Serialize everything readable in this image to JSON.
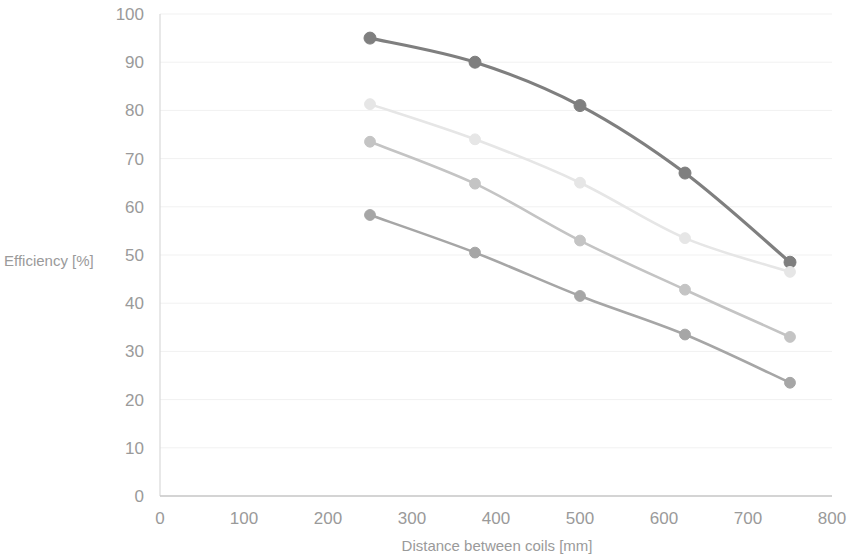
{
  "chart_data": {
    "type": "line",
    "title": "",
    "xlabel": "Distance between coils [mm]",
    "ylabel": "Efficiency [%]",
    "xlim": [
      0,
      800
    ],
    "ylim": [
      0,
      100
    ],
    "xticks": [
      0,
      100,
      200,
      300,
      400,
      500,
      600,
      700,
      800
    ],
    "yticks": [
      0,
      10,
      20,
      30,
      40,
      50,
      60,
      70,
      80,
      90,
      100
    ],
    "grid": true,
    "grid_axis": "y",
    "legend": "none",
    "markers": "circle",
    "x": [
      250,
      375,
      500,
      625,
      750
    ],
    "series": [
      {
        "name": "series-1",
        "color": "#7f7f7f",
        "values": [
          95.0,
          90.0,
          81.0,
          67.0,
          48.5
        ]
      },
      {
        "name": "series-2",
        "color": "#e6e6e6",
        "values": [
          81.3,
          74.0,
          65.0,
          53.5,
          46.5
        ]
      },
      {
        "name": "series-3",
        "color": "#c4c4c4",
        "values": [
          73.5,
          64.8,
          53.0,
          42.8,
          33.0
        ]
      },
      {
        "name": "series-4",
        "color": "#a6a6a6",
        "values": [
          58.3,
          50.5,
          41.5,
          33.5,
          23.5
        ]
      }
    ]
  },
  "style": {
    "axis_color": "#d9d9d9",
    "grid_color": "#f1f1f1",
    "tick_label_color": "#9a9a9a",
    "background": "#ffffff"
  }
}
